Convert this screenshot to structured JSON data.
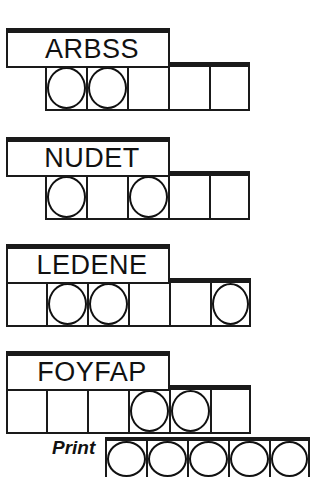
{
  "sheet": {
    "title": "Word scramble answer grid worksheet",
    "ink_color": "#1a1a1a",
    "paper_color": "#ffffff"
  },
  "rows": [
    {
      "id": "row-1",
      "word": "ARBSS",
      "cell_count": 5,
      "circled_cells": [
        1,
        2
      ],
      "cells": [
        "",
        "",
        "",
        "",
        ""
      ]
    },
    {
      "id": "row-2",
      "word": "NUDET",
      "cell_count": 5,
      "circled_cells": [
        1,
        3
      ],
      "cells": [
        "",
        "",
        "",
        "",
        ""
      ]
    },
    {
      "id": "row-3",
      "word": "LEDENE",
      "cell_count": 6,
      "circled_cells": [
        2,
        3,
        6
      ],
      "cells": [
        "",
        "",
        "",
        "",
        "",
        ""
      ]
    },
    {
      "id": "row-4",
      "word": "FOYFAP",
      "cell_count": 6,
      "circled_cells": [
        4,
        5
      ],
      "cells": [
        "",
        "",
        "",
        "",
        "",
        ""
      ]
    }
  ],
  "print_row": {
    "label": "Print",
    "cell_count": 5,
    "circled_cells": [
      1,
      2,
      3,
      4,
      5
    ],
    "cells": [
      "",
      "",
      "",
      "",
      ""
    ]
  }
}
